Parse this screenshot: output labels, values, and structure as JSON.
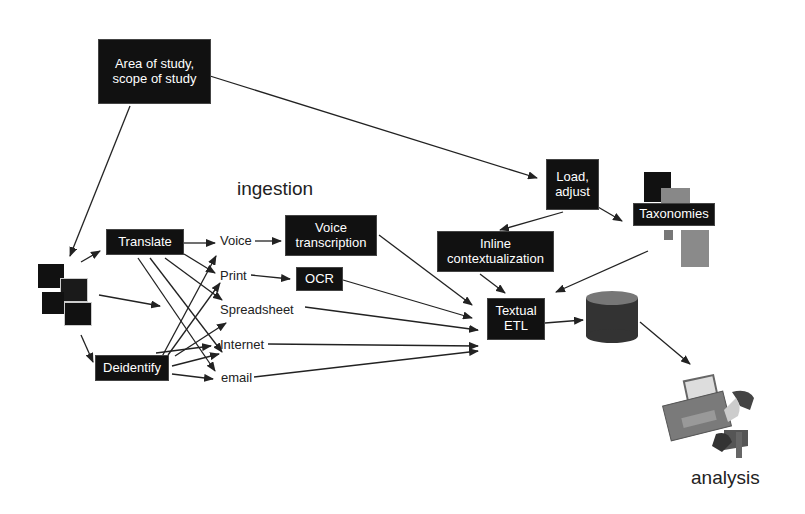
{
  "diagram": {
    "title": "ingestion",
    "output_label": "analysis",
    "nodes": {
      "scope": "Area of study, scope of study",
      "translate": "Translate",
      "deidentify": "Deidentify",
      "voice_transcription": "Voice transcription",
      "ocr": "OCR",
      "load_adjust": "Load, adjust",
      "inline_contextualization": "Inline contextualization",
      "taxonomies": "Taxonomies",
      "textual_etl": "Textual ETL"
    },
    "sources": [
      "Voice",
      "Print",
      "Spreadsheet",
      "Internet",
      "email"
    ],
    "icons": {
      "documents": "documents-icon",
      "database": "database-icon",
      "taxonomy_blocks": "taxonomy-blocks-icon",
      "workstation": "workstation-analysis-icon"
    },
    "colors": {
      "box_fill": "#111111",
      "box_text": "#ffffff",
      "line": "#222222",
      "db_fill": "#3a3a3a",
      "gray_block": "#888888"
    }
  }
}
